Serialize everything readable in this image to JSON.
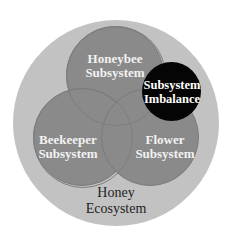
{
  "diagram": {
    "type": "venn",
    "outer": {
      "label_line1": "Honey",
      "label_line2": "Ecosystem",
      "color": "#c2c2c2"
    },
    "circles": [
      {
        "id": "honeybee",
        "line1": "Honeybee",
        "line2": "Subsystem",
        "color": "#8a8a8a"
      },
      {
        "id": "beekeeper",
        "line1": "Beekeeper",
        "line2": "Subsystem",
        "color": "#8a8a8a"
      },
      {
        "id": "flower",
        "line1": "Flower",
        "line2": "Subsystem",
        "color": "#8a8a8a"
      }
    ],
    "highlight": {
      "line1": "Subsystem",
      "line2": "Imbalance",
      "color": "#050505"
    }
  }
}
